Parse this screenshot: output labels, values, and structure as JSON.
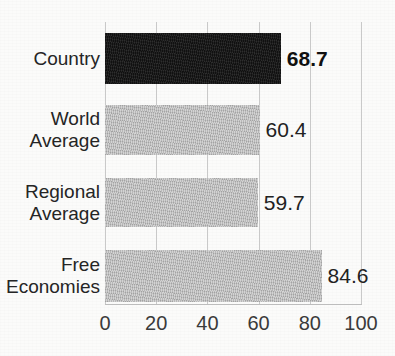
{
  "chart_data": {
    "type": "bar",
    "orientation": "horizontal",
    "title": "",
    "title_visible": false,
    "xlabel": "",
    "ylabel": "",
    "xlim": [
      0,
      100
    ],
    "xticks": [
      0,
      20,
      40,
      60,
      80,
      100
    ],
    "xtick_labels": [
      "0",
      "20",
      "40",
      "60",
      "80",
      "100"
    ],
    "grid": true,
    "grid_axis": "x",
    "legend": false,
    "categories": [
      "Country",
      "World Average",
      "Regional Average",
      "Free Economies"
    ],
    "values": [
      68.7,
      60.4,
      59.7,
      84.6
    ],
    "value_labels": [
      "68.7",
      "60.4",
      "59.7",
      "84.6"
    ],
    "bars": [
      {
        "category": "Country",
        "label_lines": [
          "Country"
        ],
        "value": 68.7,
        "value_label": "68.7",
        "color": "#1a1a1a",
        "highlighted": true
      },
      {
        "category": "World Average",
        "label_lines": [
          "World",
          "Average"
        ],
        "value": 60.4,
        "value_label": "60.4",
        "color": "#b4b4b4",
        "highlighted": false
      },
      {
        "category": "Regional Average",
        "label_lines": [
          "Regional",
          "Average"
        ],
        "value": 59.7,
        "value_label": "59.7",
        "color": "#b4b4b4",
        "highlighted": false
      },
      {
        "category": "Free Economies",
        "label_lines": [
          "Free",
          "Economies"
        ],
        "value": 84.6,
        "value_label": "84.6",
        "color": "#b4b4b4",
        "highlighted": false
      }
    ]
  },
  "colors": {
    "background": "#fbfbfa",
    "gridline": "#c9c9c9",
    "axis": "#bdbdbd",
    "bar_default": "#b4b4b4",
    "bar_highlight": "#1a1a1a",
    "text": "#252525"
  }
}
